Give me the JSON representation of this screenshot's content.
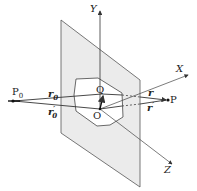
{
  "diagram": {
    "axes": {
      "x": "X",
      "y": "Y",
      "z": "Z"
    },
    "points": {
      "p0": "P",
      "p0_sub": "0",
      "p": "P",
      "o": "O",
      "q": "Q"
    },
    "vectors": {
      "r0": "r",
      "r0_sub": "0",
      "r0p": "r",
      "r0p_sub": "0",
      "r0p_prime": "′",
      "r": "r",
      "rp": "r",
      "rp_prime": "′"
    },
    "colors": {
      "plane_fill": "#ebebeb",
      "line": "#333333",
      "dashed": "#555555"
    }
  }
}
